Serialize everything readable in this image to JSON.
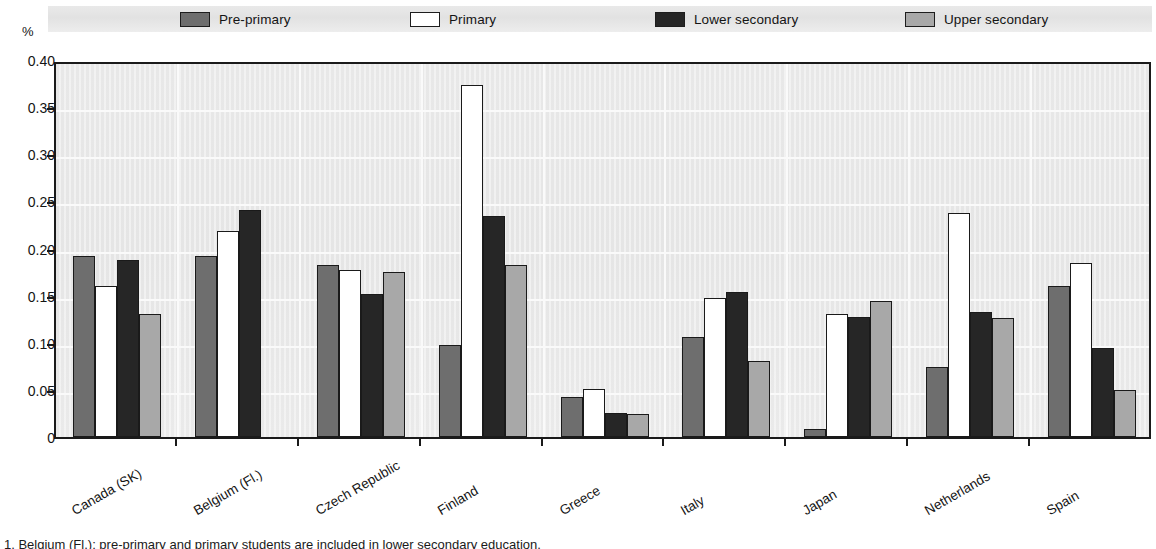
{
  "units_label": "%",
  "footnote": "1. Belgium (Fl.): pre-primary and primary students are included in lower secondary education.",
  "legend": {
    "items": [
      {
        "label": "Pre-primary",
        "color": "#6e6e6e",
        "left": 180
      },
      {
        "label": "Primary",
        "color": "#ffffff",
        "left": 410
      },
      {
        "label": "Lower secondary",
        "color": "#262626",
        "left": 655
      },
      {
        "label": "Upper secondary",
        "color": "#a8a8a8",
        "left": 905
      }
    ]
  },
  "chart_data": {
    "type": "bar",
    "title": "",
    "xlabel": "",
    "ylabel": "%",
    "ylim": [
      0,
      0.4
    ],
    "yticks": [
      "0",
      "0.05",
      "0.10",
      "0.15",
      "0.20",
      "0.25",
      "0.30",
      "0.35",
      "0.40"
    ],
    "ytick_values": [
      0,
      0.05,
      0.1,
      0.15,
      0.2,
      0.25,
      0.3,
      0.35,
      0.4
    ],
    "grid": true,
    "legend_position": "top",
    "categories": [
      "Canada (SK)",
      "Belgium (Fl.)",
      "Czech Republic",
      "Finland",
      "Greece",
      "Italy",
      "Japan",
      "Netherlands",
      "Spain"
    ],
    "series": [
      {
        "name": "Pre-primary",
        "color": "#6e6e6e",
        "values": [
          0.192,
          0.192,
          0.182,
          0.098,
          0.042,
          0.106,
          0.008,
          0.074,
          0.16
        ]
      },
      {
        "name": "Primary",
        "color": "#ffffff",
        "values": [
          0.16,
          0.219,
          0.177,
          0.373,
          0.051,
          0.148,
          0.13,
          0.238,
          0.185
        ]
      },
      {
        "name": "Lower secondary",
        "color": "#262626",
        "values": [
          0.188,
          0.241,
          0.152,
          0.234,
          0.026,
          0.154,
          0.127,
          0.133,
          0.094
        ]
      },
      {
        "name": "Upper secondary",
        "color": "#a8a8a8",
        "values": [
          0.13,
          0.0,
          0.175,
          0.183,
          0.024,
          0.081,
          0.144,
          0.126,
          0.05
        ]
      }
    ]
  }
}
